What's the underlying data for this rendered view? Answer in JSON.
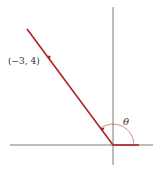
{
  "diagram": {
    "point_label": "(−3, 4)",
    "angle_label": "θ",
    "colors": {
      "ray": "#b22222",
      "axis": "#555555",
      "arc": "#b22222",
      "text": "#333333"
    },
    "elements": {
      "x_axis": {
        "x1": 10,
        "y1": 145,
        "x2": 153,
        "y2": 145
      },
      "y_axis": {
        "x1": 113,
        "y1": 7,
        "x2": 113,
        "y2": 165
      },
      "ray": {
        "x1": 113,
        "y1": 145,
        "x2": 27,
        "y2": 29
      },
      "positive_x_segment": {
        "x1": 113,
        "y1": 145,
        "x2": 139,
        "y2": 145
      },
      "point": {
        "cx": 49,
        "cy": 57
      },
      "arc_radius": 21
    }
  }
}
